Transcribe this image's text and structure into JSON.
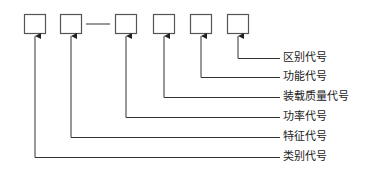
{
  "diagram": {
    "type": "code-structure",
    "colors": {
      "line": "#333333",
      "box_border": "#555555",
      "text": "#222222"
    },
    "boxes": [
      {
        "id": "box-1",
        "x": 24,
        "y": 14,
        "w": 21,
        "h": 19
      },
      {
        "id": "box-2",
        "x": 60,
        "y": 14,
        "w": 21,
        "h": 19
      },
      {
        "id": "box-3",
        "x": 115,
        "y": 14,
        "w": 21,
        "h": 19
      },
      {
        "id": "box-4",
        "x": 153,
        "y": 14,
        "w": 21,
        "h": 19
      },
      {
        "id": "box-5",
        "x": 190,
        "y": 14,
        "w": 21,
        "h": 19
      },
      {
        "id": "box-6",
        "x": 227,
        "y": 14,
        "w": 21,
        "h": 19
      }
    ],
    "dash_between": {
      "from": "box-2",
      "to": "box-3"
    },
    "labels": [
      {
        "text": "区别代号",
        "box": "box-6",
        "y": 58
      },
      {
        "text": "功能代号",
        "box": "box-5",
        "y": 77
      },
      {
        "text": "装载质量代号",
        "box": "box-4",
        "y": 97
      },
      {
        "text": "功率代号",
        "box": "box-3",
        "y": 117
      },
      {
        "text": "特征代号",
        "box": "box-2",
        "y": 137
      },
      {
        "text": "类别代号",
        "box": "box-1",
        "y": 157
      }
    ]
  }
}
